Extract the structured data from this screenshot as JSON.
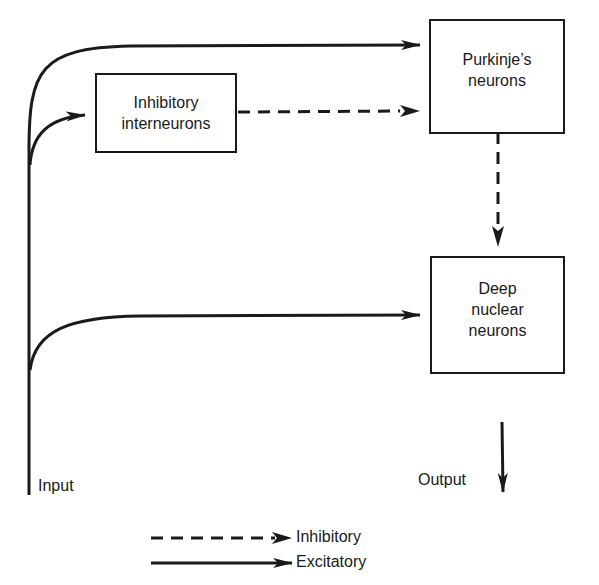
{
  "diagram": {
    "nodes": {
      "inhibitory_interneurons": {
        "lines": [
          "Inhibitory",
          "interneurons"
        ]
      },
      "purkinje": {
        "lines": [
          "Purkinje’s",
          "neurons"
        ]
      },
      "deep_nuclear": {
        "lines": [
          "Deep",
          "nuclear",
          "neurons"
        ]
      }
    },
    "labels": {
      "input": "Input",
      "output": "Output"
    },
    "edges": [
      {
        "from": "Input",
        "to": "Purkinje's neurons",
        "type": "excitatory"
      },
      {
        "from": "Input",
        "to": "Inhibitory interneurons",
        "type": "excitatory"
      },
      {
        "from": "Inhibitory interneurons",
        "to": "Purkinje's neurons",
        "type": "inhibitory"
      },
      {
        "from": "Purkinje's neurons",
        "to": "Deep nuclear neurons",
        "type": "inhibitory"
      },
      {
        "from": "Input",
        "to": "Deep nuclear neurons",
        "type": "excitatory"
      },
      {
        "from": "Deep nuclear neurons",
        "to": "Output",
        "type": "excitatory"
      }
    ],
    "legend": {
      "inhibitory": "Inhibitory",
      "excitatory": "Excitatory"
    },
    "colors": {
      "line": "#1a1a1a",
      "background": "#ffffff"
    }
  }
}
